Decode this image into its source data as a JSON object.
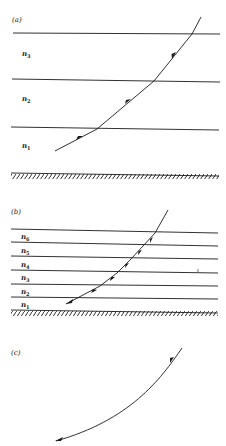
{
  "figure": {
    "panels": [
      {
        "id": "a",
        "label": "(a)",
        "layers": [
          {
            "name": "n",
            "sub": "3"
          },
          {
            "name": "n",
            "sub": "2"
          },
          {
            "name": "n",
            "sub": "1"
          }
        ],
        "description": "Ray refracting through three discrete layers above a hatched ground surface"
      },
      {
        "id": "b",
        "label": "(b)",
        "layers": [
          {
            "name": "n",
            "sub": "6"
          },
          {
            "name": "n",
            "sub": "5"
          },
          {
            "name": "n",
            "sub": "4"
          },
          {
            "name": "n",
            "sub": "3"
          },
          {
            "name": "n",
            "sub": "2"
          },
          {
            "name": "n",
            "sub": "1"
          }
        ],
        "description": "Ray bending through six thinner layers above a hatched ground surface"
      },
      {
        "id": "c",
        "label": "(c)",
        "layers": [],
        "description": "Continuous curved ray path in a continuously varying medium"
      }
    ],
    "colors": {
      "ink": "#1a1a1a",
      "background": "#ffffff"
    }
  }
}
